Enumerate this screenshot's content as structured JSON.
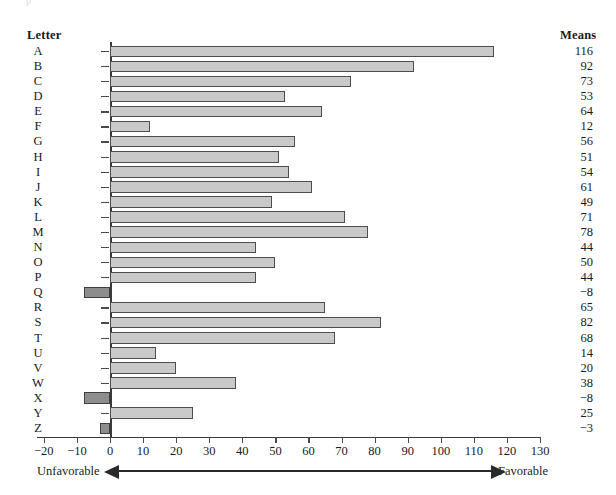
{
  "headers": {
    "letter": "Letter",
    "means": "Means"
  },
  "axis_band": {
    "left_label": "Unfavorable",
    "right_label": "Favorable"
  },
  "top_clip": {
    "left_fragment": "p",
    "right_fragment": ""
  },
  "colors": {
    "positive_bar": "#c9c9c9",
    "negative_bar": "#8d8d8d",
    "bar_border": "#4d4d4d",
    "axis": "#3a3a3a",
    "text": "#1a1a1a"
  },
  "chart_data": {
    "type": "bar",
    "orientation": "horizontal",
    "title": "",
    "xlabel": "",
    "ylabel": "Letter",
    "xlim": [
      -20,
      130
    ],
    "xticks": [
      -20,
      -10,
      0,
      10,
      20,
      30,
      40,
      50,
      60,
      70,
      80,
      90,
      100,
      110,
      120,
      130
    ],
    "xticklabels": [
      "−20",
      "−10",
      "0",
      "10",
      "20",
      "30",
      "40",
      "50",
      "60",
      "70",
      "80",
      "90",
      "100",
      "110",
      "120",
      "130"
    ],
    "grid": false,
    "legend": null,
    "annotations": [
      "Unfavorable",
      "Favorable"
    ],
    "value_column_header": "Means",
    "categories": [
      "A",
      "B",
      "C",
      "D",
      "E",
      "F",
      "G",
      "H",
      "I",
      "J",
      "K",
      "L",
      "M",
      "N",
      "O",
      "P",
      "Q",
      "R",
      "S",
      "T",
      "U",
      "V",
      "W",
      "X",
      "Y",
      "Z"
    ],
    "values": [
      116,
      92,
      73,
      53,
      64,
      12,
      56,
      51,
      54,
      61,
      49,
      71,
      78,
      44,
      50,
      44,
      -8,
      65,
      82,
      68,
      14,
      20,
      38,
      -8,
      25,
      -3
    ],
    "value_labels": [
      "116",
      "92",
      "73",
      "53",
      "64",
      "12",
      "56",
      "51",
      "54",
      "61",
      "49",
      "71",
      "78",
      "44",
      "50",
      "44",
      "−8",
      "65",
      "82",
      "68",
      "14",
      "20",
      "38",
      "−8",
      "25",
      "−3"
    ]
  }
}
